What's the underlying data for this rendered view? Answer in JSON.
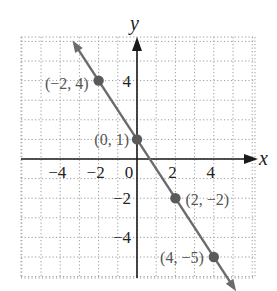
{
  "chart_data": {
    "type": "line",
    "title": "",
    "xlabel": "x",
    "ylabel": "y",
    "xlim": [
      -6,
      6
    ],
    "ylim": [
      -6,
      6
    ],
    "grid": true,
    "grid_style": "dotted",
    "x_ticks": [
      -4,
      -2,
      0,
      2,
      4
    ],
    "x_tick_labels": [
      "−4",
      "−2",
      "0",
      "2",
      "4"
    ],
    "y_ticks": [
      4,
      -2,
      -4
    ],
    "y_tick_labels": [
      "4",
      "−2",
      "−4"
    ],
    "series": [
      {
        "name": "line",
        "equation": "y = -3/2 x + 1",
        "x": [
          -2,
          0,
          2,
          4
        ],
        "y": [
          4,
          1,
          -2,
          -5
        ],
        "arrows_both_ends": true
      }
    ],
    "points": [
      {
        "x": -2,
        "y": 4,
        "label": "(−2, 4)"
      },
      {
        "x": 0,
        "y": 1,
        "label": "(0, 1)"
      },
      {
        "x": 2,
        "y": -2,
        "label": "(2, −2)"
      },
      {
        "x": 4,
        "y": -5,
        "label": "(4, −5)"
      }
    ],
    "colors": {
      "line": "#6b6b6b",
      "point": "#5a5a5a",
      "axis": "#1a1a1a",
      "grid": "#9a9a9a"
    }
  }
}
